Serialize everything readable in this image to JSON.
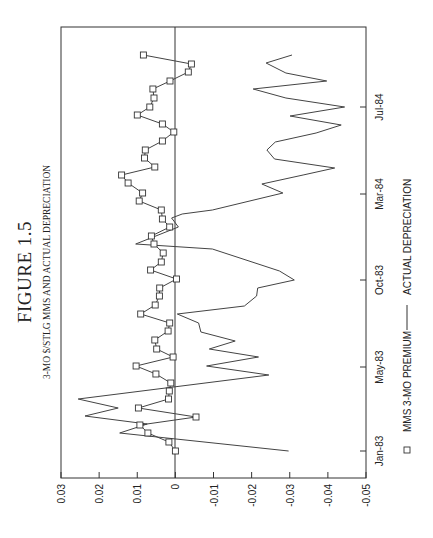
{
  "figure": {
    "title": "FIGURE 1.5",
    "subtitle": "3-MO $/STLG MMS AND ACTUAL DEPRECIATION"
  },
  "legend": {
    "items": [
      {
        "label": "MMS 3-MO PREMIUM",
        "marker": "square"
      },
      {
        "label": "ACTUAL DEPRECIATION",
        "marker": "line"
      }
    ]
  },
  "axes": {
    "value_ticks": [
      "0.03",
      "0.02",
      "0.01",
      "0",
      "-0.01",
      "-0.02",
      "-0.03",
      "-0.04",
      "-0.05"
    ],
    "date_ticks": [
      "Jan-83",
      "May-83",
      "Oct-83",
      "Mar-84",
      "Jul-84"
    ]
  },
  "chart_data": {
    "type": "line",
    "title": "FIGURE 1.5",
    "subtitle": "3-MO $/STLG MMS AND ACTUAL DEPRECIATION",
    "orientation": "rotated 90 degrees counter-clockwise (time runs bottom-to-top, values left-to-right)",
    "xlabel": "",
    "ylabel": "",
    "x_ticks": [
      "Jan-83",
      "May-83",
      "Oct-83",
      "Mar-84",
      "Jul-84"
    ],
    "ylim": [
      -0.05,
      0.03
    ],
    "y_ticks": [
      0.03,
      0.02,
      0.01,
      0,
      -0.01,
      -0.02,
      -0.03,
      -0.04,
      -0.05
    ],
    "grid": false,
    "zero_line": true,
    "legend_position": "bottom",
    "series": [
      {
        "name": "MMS 3-MO PREMIUM",
        "marker": "square",
        "values": [
          0.0,
          0.0017,
          0.0072,
          0.0093,
          -0.0054,
          0.0097,
          0.0018,
          0.0016,
          0.0012,
          0.0051,
          0.0103,
          0.0006,
          0.0049,
          0.0054,
          0.0019,
          0.0015,
          0.0091,
          0.0053,
          0.0042,
          0.0041,
          -0.0003,
          0.0065,
          0.0037,
          0.0032,
          0.0056,
          0.0063,
          0.0015,
          0.0034,
          0.0037,
          0.0095,
          0.0086,
          0.0124,
          0.0141,
          0.0054,
          0.0081,
          0.0079,
          0.0034,
          0.0004,
          0.0034,
          0.01,
          0.0067,
          0.0056,
          0.0059,
          0.0014,
          -0.0034,
          -0.0042,
          0.0084
        ],
        "pos": [
          451,
          442,
          433,
          425,
          417,
          408,
          399,
          391,
          383,
          374,
          366,
          357,
          349,
          340,
          331,
          323,
          314,
          305,
          296,
          288,
          279,
          270,
          262,
          253,
          244,
          236,
          227,
          219,
          210,
          201,
          193,
          183,
          175,
          167,
          158,
          150,
          141,
          132,
          124,
          115,
          107,
          98,
          89,
          81,
          72,
          64,
          55
        ]
      },
      {
        "name": "ACTUAL DEPRECIATION",
        "marker": "none",
        "values": [
          -0.0297,
          0.0146,
          0.0074,
          0.0237,
          0.015,
          0.0255,
          -0.0245,
          -0.0082,
          -0.0218,
          -0.0089,
          -0.0157,
          -0.0067,
          -0.0061,
          -0.0005,
          -0.0181,
          -0.0213,
          -0.0216,
          -0.0312,
          -0.0273,
          -0.0097,
          0.0104,
          -0.0008,
          0.001,
          -0.0018,
          -0.0097,
          -0.0282,
          -0.0227,
          -0.0335,
          -0.0418,
          -0.026,
          -0.024,
          -0.0262,
          -0.0369,
          -0.0435,
          -0.0301,
          -0.0444,
          -0.029,
          -0.0204,
          -0.0397,
          -0.029,
          -0.0238,
          -0.0306
        ],
        "pos": [
          451,
          433,
          424,
          416,
          408,
          399,
          375,
          366,
          357,
          349,
          341,
          332,
          323,
          314,
          306,
          296,
          288,
          280,
          271,
          249,
          244,
          227,
          218,
          214,
          210,
          193,
          184,
          175,
          168,
          159,
          150,
          142,
          133,
          125,
          116,
          107,
          98,
          89,
          81,
          73,
          63,
          55
        ]
      }
    ]
  }
}
